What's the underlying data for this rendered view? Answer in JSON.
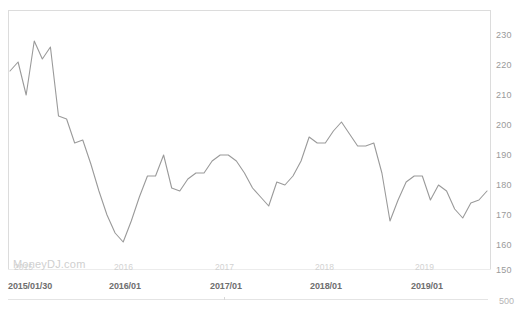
{
  "chart_data": {
    "type": "line",
    "title": "",
    "xlabel": "",
    "ylabel": "",
    "ylim": [
      150,
      235
    ],
    "yticks": [
      230,
      220,
      210,
      200,
      190,
      180,
      170,
      160,
      150
    ],
    "extra_axis_label": "500",
    "grid": false,
    "legend": "none",
    "watermark": "MoneyDJ.com",
    "line_color": "#9a9a9a",
    "xtick_labels_main": [
      "2015/01/30",
      "2016/01",
      "2017/01",
      "2018/01",
      "2019/01"
    ],
    "xtick_labels_faint": [
      "2015",
      "2016",
      "2017",
      "2018",
      "2019"
    ],
    "x_start": "2015/01/30",
    "series": [
      {
        "name": "price",
        "x": [
          "2015/01",
          "2015/02",
          "2015/03",
          "2015/04",
          "2015/05",
          "2015/06",
          "2015/07",
          "2015/08",
          "2015/09",
          "2015/10",
          "2015/11",
          "2015/12",
          "2016/01",
          "2016/02",
          "2016/03",
          "2016/04",
          "2016/05",
          "2016/06",
          "2016/07",
          "2016/08",
          "2016/09",
          "2016/10",
          "2016/11",
          "2016/12",
          "2017/01",
          "2017/02",
          "2017/03",
          "2017/04",
          "2017/05",
          "2017/06",
          "2017/07",
          "2017/08",
          "2017/09",
          "2017/10",
          "2017/11",
          "2017/12",
          "2018/01",
          "2018/02",
          "2018/03",
          "2018/04",
          "2018/05",
          "2018/06",
          "2018/07",
          "2018/08",
          "2018/09",
          "2018/10",
          "2018/11",
          "2018/12",
          "2019/01",
          "2019/02",
          "2019/03",
          "2019/04",
          "2019/05",
          "2019/06",
          "2019/07",
          "2019/08",
          "2019/09",
          "2019/10",
          "2019/11",
          "2019/12"
        ],
        "values": [
          218,
          221,
          210,
          228,
          222,
          226,
          203,
          202,
          194,
          195,
          187,
          178,
          170,
          164,
          161,
          168,
          176,
          183,
          183,
          190,
          179,
          178,
          182,
          184,
          184,
          188,
          190,
          190,
          188,
          184,
          179,
          176,
          173,
          181,
          180,
          183,
          188,
          196,
          194,
          194,
          198,
          201,
          197,
          193,
          193,
          194,
          184,
          168,
          175,
          181,
          183,
          183,
          175,
          180,
          178,
          172,
          169,
          174,
          175,
          178
        ]
      }
    ]
  },
  "axis": {
    "yticks": [
      {
        "label": "230",
        "top": 30
      },
      {
        "label": "220",
        "top": 60
      },
      {
        "label": "210",
        "top": 90
      },
      {
        "label": "200",
        "top": 120
      },
      {
        "label": "190",
        "top": 150
      },
      {
        "label": "180",
        "top": 180
      },
      {
        "label": "170",
        "top": 210
      },
      {
        "label": "160",
        "top": 240
      },
      {
        "label": "150",
        "top": 265
      }
    ],
    "extra_label": {
      "label": "500",
      "top": 296
    },
    "xticks_faint": [
      {
        "label": "2015",
        "left": 14
      },
      {
        "label": "2016",
        "left": 114
      },
      {
        "label": "2017",
        "left": 215
      },
      {
        "label": "2018",
        "left": 315
      },
      {
        "label": "2019",
        "left": 415
      }
    ],
    "xticks_main": [
      {
        "label": "2015/01/30",
        "left": 8
      },
      {
        "label": "2016/01",
        "left": 109
      },
      {
        "label": "2017/01",
        "left": 210
      },
      {
        "label": "2018/01",
        "left": 310
      },
      {
        "label": "2019/01",
        "left": 411
      }
    ]
  },
  "watermark": {
    "text": "MoneyDJ.com"
  }
}
